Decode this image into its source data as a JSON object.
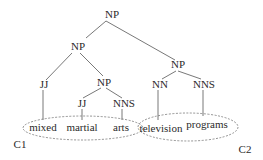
{
  "diagram": {
    "type": "parse-tree",
    "nodes": {
      "root": "NP",
      "np_left": "NP",
      "np_right": "NP",
      "jj_mixed": "JJ",
      "np_inner": "NP",
      "jj_martial": "JJ",
      "nns_arts": "NNS",
      "nn_television": "NN",
      "nns_programs": "NNS"
    },
    "words": {
      "mixed": "mixed",
      "martial": "martial",
      "arts": "arts",
      "television": "television",
      "programs": "programs"
    },
    "clusters": {
      "c1": "C1",
      "c2": "C2"
    },
    "edges": [
      [
        "root",
        "np_left"
      ],
      [
        "root",
        "np_right"
      ],
      [
        "np_left",
        "jj_mixed"
      ],
      [
        "np_left",
        "np_inner"
      ],
      [
        "np_inner",
        "jj_martial"
      ],
      [
        "np_inner",
        "nns_arts"
      ],
      [
        "np_right",
        "nn_television"
      ],
      [
        "np_right",
        "nns_programs"
      ],
      [
        "jj_mixed",
        "mixed"
      ],
      [
        "jj_martial",
        "martial"
      ],
      [
        "nns_arts",
        "arts"
      ],
      [
        "nn_television",
        "television"
      ],
      [
        "nns_programs",
        "programs"
      ]
    ]
  }
}
